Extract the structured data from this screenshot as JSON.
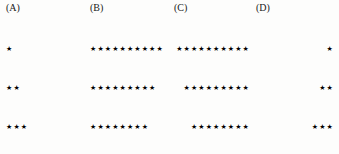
{
  "figure": {
    "background_color": "#fdfdfc",
    "star_color": "#000000",
    "label_color": "#1a1a1a",
    "star_glyph": "★",
    "panels": [
      {
        "id": "a",
        "label": "(A)",
        "alignment": "left",
        "direction": "increasing",
        "row_counts": [
          1,
          2,
          3,
          4,
          5,
          6,
          7,
          8,
          9,
          10
        ],
        "rows": [
          "★",
          "★★",
          "★★★",
          "★★★★",
          "★★★★★",
          "★★★★★★",
          "★★★★★★★",
          "★★★★★★★★",
          "★★★★★★★★★",
          "★★★★★★★★★★"
        ]
      },
      {
        "id": "b",
        "label": "(B)",
        "alignment": "left",
        "direction": "decreasing",
        "row_counts": [
          10,
          9,
          8,
          7,
          6,
          5,
          4,
          3,
          2,
          1
        ],
        "rows": [
          "★★★★★★★★★★",
          "★★★★★★★★★",
          "★★★★★★★★",
          "★★★★★★★",
          "★★★★★★",
          "★★★★★",
          "★★★★",
          "★★★",
          "★★",
          "★"
        ]
      },
      {
        "id": "c",
        "label": "(C)",
        "alignment": "right",
        "direction": "decreasing",
        "row_counts": [
          10,
          9,
          8,
          7,
          6,
          5,
          4,
          3,
          2,
          1
        ],
        "rows": [
          "★★★★★★★★★★",
          "★★★★★★★★★",
          "★★★★★★★★",
          "★★★★★★★",
          "★★★★★★",
          "★★★★★",
          "★★★★",
          "★★★",
          "★★",
          "★"
        ]
      },
      {
        "id": "d",
        "label": "(D)",
        "alignment": "right",
        "direction": "increasing",
        "row_counts": [
          1,
          2,
          3,
          4,
          5,
          6,
          7,
          8,
          9,
          10
        ],
        "rows": [
          "★",
          "★★",
          "★★★",
          "★★★★",
          "★★★★★",
          "★★★★★★",
          "★★★★★★★",
          "★★★★★★★★",
          "★★★★★★★★★",
          "★★★★★★★★★★"
        ]
      }
    ]
  }
}
